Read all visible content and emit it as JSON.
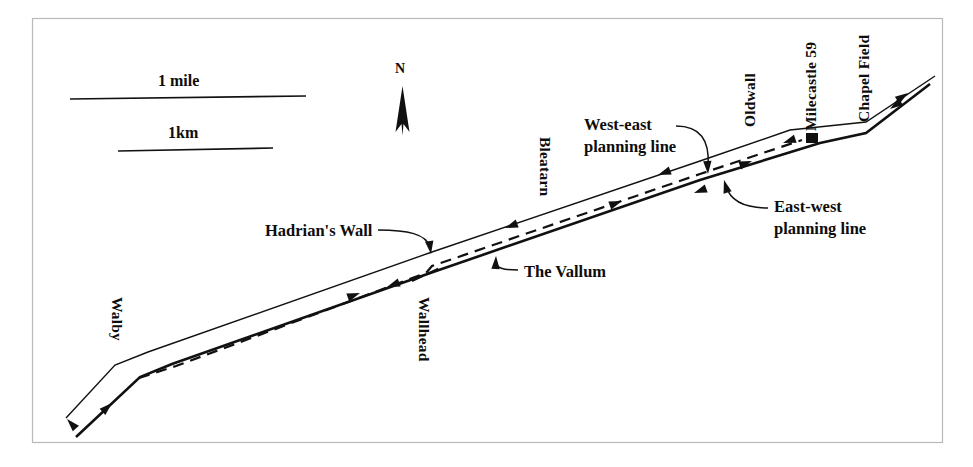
{
  "figure": {
    "kind": "archaeological-survey-map",
    "background_color": "#ffffff",
    "ink_color": "#111111",
    "frame_color": "#b9b9b9"
  },
  "scale": {
    "mile_label": "1 mile",
    "km_label": "1km"
  },
  "compass": {
    "north_label": "N"
  },
  "places": [
    {
      "id": "walby",
      "label": "Walby"
    },
    {
      "id": "wallhead",
      "label": "Wallhead"
    },
    {
      "id": "bleatarn",
      "label": "Bleatarn"
    },
    {
      "id": "oldwall",
      "label": "Oldwall"
    },
    {
      "id": "milecastle59",
      "label": "Milecastle 59"
    },
    {
      "id": "chapelfield",
      "label": "Chapel Field"
    }
  ],
  "annotations": [
    {
      "id": "west-east-planning-line",
      "line1": "West-east",
      "line2": "planning line"
    },
    {
      "id": "east-west-planning-line",
      "line1": "East-west",
      "line2": "planning line"
    },
    {
      "id": "hadrians-wall",
      "line1": "Hadrian's Wall",
      "line2": ""
    },
    {
      "id": "the-vallum",
      "line1": "The Vallum",
      "line2": ""
    }
  ],
  "legend_features": {
    "wall_name": "Hadrian's Wall",
    "vallum_name": "The Vallum",
    "marker_name": "Milecastle 59"
  }
}
